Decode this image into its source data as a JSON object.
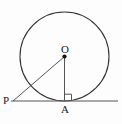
{
  "figure": {
    "type": "geometry-diagram",
    "background_color": "#fdfdfd",
    "stroke_color": "#333333",
    "label_color": "#1a1a1a",
    "width": 122,
    "height": 124
  },
  "labels": {
    "center": "O",
    "external_point": "P",
    "tangent_point": "A"
  },
  "points": {
    "O": {
      "x": 64.5,
      "y": 56.5,
      "name": "center-point"
    },
    "P": {
      "x": 13.0,
      "y": 101.0,
      "name": "external-point"
    },
    "A": {
      "x": 64.5,
      "y": 101.0,
      "name": "tangency-point"
    }
  },
  "circle": {
    "cx": 64.5,
    "cy": 56.5,
    "r": 44.5,
    "name": "main-circle"
  },
  "segments": [
    {
      "name": "segment-PO",
      "from": "P",
      "to": "O",
      "x1": 13.0,
      "y1": 101.0,
      "x2": 64.5,
      "y2": 56.5
    },
    {
      "name": "segment-OA",
      "from": "O",
      "to": "A",
      "x1": 64.5,
      "y1": 56.5,
      "x2": 64.5,
      "y2": 101.0
    }
  ],
  "tangent_line": {
    "name": "tangent-line",
    "x1": 11.0,
    "y1": 101.0,
    "x2": 118.0,
    "y2": 101.0
  },
  "right_angle_marker": {
    "name": "right-angle-marker",
    "at": "A",
    "size": 7,
    "description": "square marker indicating 90 degrees between OA and the tangent line"
  }
}
